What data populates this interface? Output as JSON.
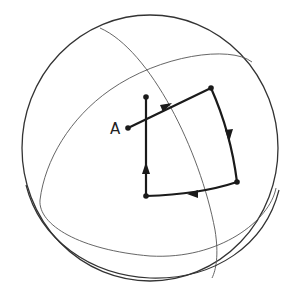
{
  "diagram": {
    "type": "sphere-parallel-transport",
    "labels": {
      "point_a": "A"
    },
    "colors": {
      "sphere": "#333333",
      "gridlines": "#555555",
      "path": "#1a1a1a",
      "background": "#ffffff"
    },
    "path": {
      "start": "A",
      "vertices": [
        [
          128,
          128
        ],
        [
          211,
          88
        ],
        [
          237,
          182
        ],
        [
          146,
          196
        ],
        [
          146,
          97
        ]
      ],
      "arrow_directions": [
        "along-top-right",
        "down",
        "left",
        "up"
      ]
    }
  }
}
